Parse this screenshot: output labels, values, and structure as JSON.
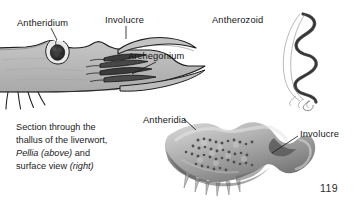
{
  "figure": {
    "page_number": "119",
    "caption": {
      "line1": "Section through the",
      "line2": "thallus of the liverwort,",
      "line3_italic": "Pellia (above)",
      "line3_rest": " and",
      "line4_plain": "surface view ",
      "line4_italic": "(right)"
    },
    "labels": {
      "antheridium": "Antheridium",
      "involucre_top": "Involucre",
      "archegonium": "Archegonium",
      "antherozoid": "Antherozoid",
      "antheridia": "Antheridia",
      "involucre_lower": "Involucre"
    },
    "colors": {
      "thallus_fill": "#b9b9b9",
      "thallus_outline": "#1d1d1d",
      "antheridium_dark": "#2b2b2b",
      "archegonium_dark": "#3a3a3a",
      "photo_light": "#cfcfcf",
      "photo_mid": "#9a9a9a",
      "photo_dark": "#5d5d5d",
      "label_text": "#161616",
      "leader_line": "#1a1a1a",
      "background": "#ffffff"
    },
    "panels": {
      "top_left": "longitudinal-section-of-pellia-thallus",
      "top_right": "antherozoid-spiral-sperm",
      "bottom_right": "surface-view-photograph-of-thallus"
    }
  }
}
